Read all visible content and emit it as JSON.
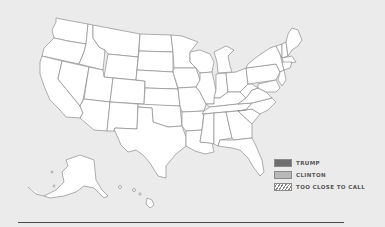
{
  "map": {
    "title": "US Election Map",
    "background_color": "#ebebeb",
    "state_fill": "#ffffff",
    "state_stroke": "#8c8c8c"
  },
  "legend": {
    "items": [
      {
        "label": "TRUMP",
        "color": "#6e6e6e",
        "pattern": "solid"
      },
      {
        "label": "CLINTON",
        "color": "#b8b8b8",
        "pattern": "solid"
      },
      {
        "label": "TOO CLOSE TO CALL",
        "color": "#ffffff",
        "pattern": "hatched"
      }
    ]
  }
}
